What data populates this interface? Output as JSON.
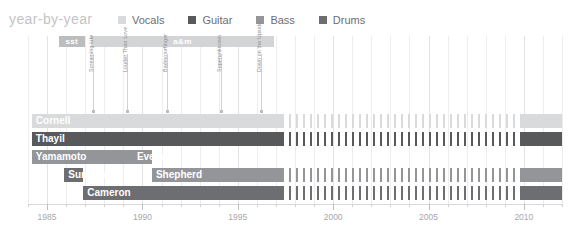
{
  "header": {
    "title": "year-by-year"
  },
  "legend": {
    "items": [
      {
        "label": "Vocals",
        "color": "#d9dadb"
      },
      {
        "label": "Guitar",
        "color": "#58595b"
      },
      {
        "label": "Bass",
        "color": "#939598"
      },
      {
        "label": "Drums",
        "color": "#6d6e71"
      }
    ]
  },
  "chart_data": {
    "type": "bar",
    "title": "year-by-year",
    "xlabel": "",
    "ylabel": "",
    "xlim": [
      1984,
      2012
    ],
    "grid": true,
    "legend_position": "top",
    "axis": {
      "major_ticks": [
        1985,
        1990,
        1995,
        2000,
        2005,
        2010
      ],
      "tick_labels": [
        "1985",
        "1990",
        "1995",
        "2000",
        "2005",
        "2010"
      ],
      "minor_tick_step": 1
    },
    "label_eras": [
      {
        "name": "sst",
        "start": 1985.6,
        "end": 1987.0,
        "color": "#bcbdbf"
      },
      {
        "name": "a&m",
        "start": 1987.3,
        "end": 1996.9,
        "color": "#d3d4d6"
      }
    ],
    "milestones": [
      {
        "label": "Screaming Life",
        "year": 1987.4
      },
      {
        "label": "Louder Than Love",
        "year": 1989.2
      },
      {
        "label": "Badmotorfinger",
        "year": 1991.3
      },
      {
        "label": "Superunknown",
        "year": 1994.1
      },
      {
        "label": "Down on the Upside",
        "year": 1996.2
      }
    ],
    "categories": [
      "Cornell",
      "Thayil",
      "Yamamoto",
      "Everman",
      "Sundquist",
      "Shepherd",
      "Cameron"
    ],
    "series": [
      {
        "name": "Cornell",
        "role": "Vocals",
        "color": "#d9dadb",
        "row": 0,
        "segments": [
          {
            "start": 1984.2,
            "end": 1997.3,
            "style": "solid"
          },
          {
            "start": 1997.3,
            "end": 2009.9,
            "style": "striped"
          },
          {
            "start": 2009.9,
            "end": 2012.0,
            "style": "solid"
          }
        ]
      },
      {
        "name": "Thayil",
        "role": "Guitar",
        "color": "#58595b",
        "row": 1,
        "segments": [
          {
            "start": 1984.2,
            "end": 1997.3,
            "style": "solid"
          },
          {
            "start": 1997.3,
            "end": 2009.9,
            "style": "striped"
          },
          {
            "start": 2009.9,
            "end": 2012.0,
            "style": "solid"
          }
        ]
      },
      {
        "name": "Yamamoto",
        "role": "Bass",
        "color": "#939598",
        "row": 2,
        "segments": [
          {
            "start": 1984.2,
            "end": 1989.5,
            "style": "solid"
          }
        ]
      },
      {
        "name": "Everman",
        "role": "Bass",
        "color": "#939598",
        "row": 2,
        "segments": [
          {
            "start": 1989.5,
            "end": 1990.5,
            "style": "solid"
          }
        ],
        "label_outside": true
      },
      {
        "name": "Sundquist",
        "role": "Drums",
        "color": "#6d6e71",
        "row": 3,
        "segments": [
          {
            "start": 1985.9,
            "end": 1986.9,
            "style": "solid"
          }
        ]
      },
      {
        "name": "Shepherd",
        "role": "Bass",
        "color": "#939598",
        "row": 3,
        "segments": [
          {
            "start": 1990.5,
            "end": 1997.3,
            "style": "solid"
          },
          {
            "start": 1997.3,
            "end": 2009.9,
            "style": "striped"
          },
          {
            "start": 2009.9,
            "end": 2012.0,
            "style": "solid"
          }
        ]
      },
      {
        "name": "Cameron",
        "role": "Drums",
        "color": "#6d6e71",
        "row": 4,
        "segments": [
          {
            "start": 1986.9,
            "end": 1997.3,
            "style": "solid"
          },
          {
            "start": 1997.3,
            "end": 2009.9,
            "style": "striped"
          },
          {
            "start": 2009.9,
            "end": 2012.0,
            "style": "solid"
          }
        ]
      }
    ]
  }
}
